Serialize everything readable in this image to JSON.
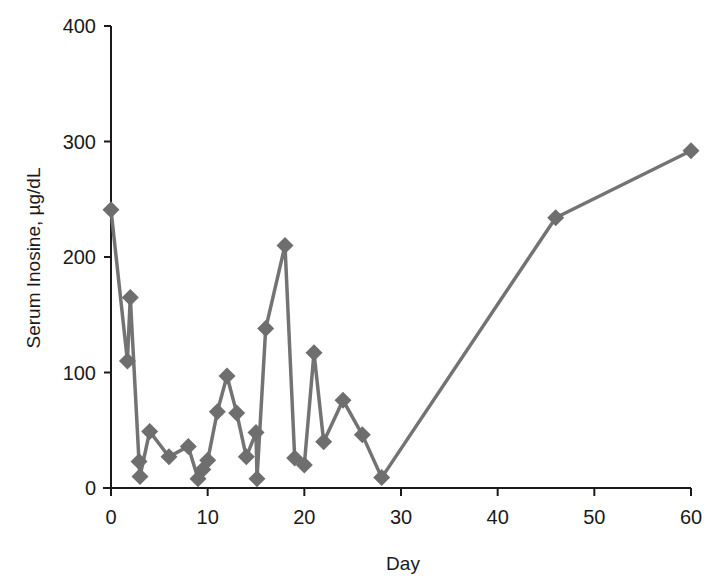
{
  "chart_data": {
    "type": "line",
    "title": "",
    "xlabel": "Day",
    "ylabel": "Serum Inosine, µg/dL",
    "xlim": [
      0,
      60
    ],
    "ylim": [
      0,
      400
    ],
    "xticks": [
      0,
      10,
      20,
      30,
      40,
      50,
      60
    ],
    "yticks": [
      0,
      100,
      200,
      300,
      400
    ],
    "grid": false,
    "legend": null,
    "series": [
      {
        "name": "Serum Inosine",
        "marker": "diamond",
        "color": "#6e6e6e",
        "x": [
          0,
          1.7,
          2,
          2.9,
          3,
          4,
          6,
          8,
          9,
          9.5,
          10,
          11,
          12,
          13,
          14,
          15,
          15.1,
          16,
          18,
          19,
          20,
          21,
          22,
          24,
          26,
          28,
          46,
          60
        ],
        "y": [
          241,
          110,
          165,
          23,
          10,
          49,
          27,
          36,
          8,
          16,
          24,
          66,
          97,
          65,
          27,
          48,
          8,
          138,
          210,
          26,
          20,
          117,
          40,
          76,
          46,
          9,
          234,
          292
        ]
      }
    ]
  }
}
